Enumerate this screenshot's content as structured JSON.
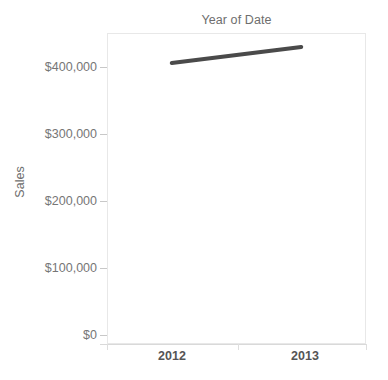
{
  "chart_data": {
    "type": "line",
    "title": "Year of Date",
    "xlabel": "",
    "ylabel": "Sales",
    "x": [
      "2012",
      "2013"
    ],
    "categories": [
      "2012",
      "2013"
    ],
    "values": [
      406000,
      430000
    ],
    "series": [
      {
        "name": "Sales",
        "color": "#4a4a4a",
        "values": [
          406000,
          430000
        ]
      }
    ],
    "xtick_labels": [
      "2012",
      "2013"
    ],
    "ytick_labels": [
      "$0",
      "$100,000",
      "$200,000",
      "$300,000",
      "$400,000"
    ],
    "ytick_values": [
      0,
      100000,
      200000,
      300000,
      400000
    ],
    "ylim": [
      0,
      465000
    ],
    "grid": false,
    "legend": "none",
    "line_width": 4,
    "background": "#ffffff",
    "panel_border_color": "#e8e8e8",
    "axis_text_color": "#767676",
    "title_color": "#6e6e6e"
  },
  "axis": {
    "y_title": "Sales",
    "y_ticks": [
      {
        "label": "$400,000",
        "value": 400000
      },
      {
        "label": "$300,000",
        "value": 300000
      },
      {
        "label": "$200,000",
        "value": 200000
      },
      {
        "label": "$100,000",
        "value": 100000
      },
      {
        "label": "$0",
        "value": 0
      }
    ],
    "x_ticks": [
      {
        "label": "2012"
      },
      {
        "label": "2013"
      }
    ]
  },
  "header": {
    "title": "Year of Date"
  }
}
